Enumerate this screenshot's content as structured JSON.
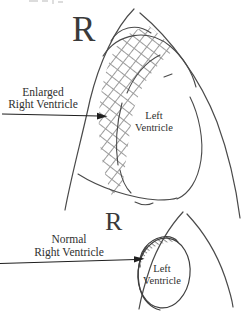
{
  "figure": {
    "background": "#ffffff",
    "line_color": "#4a4a4a",
    "hatch_color": "#9b9b9b",
    "text_color": "#2f2f2f",
    "top_panel": {
      "orientation_marker": "R",
      "pointer_label": {
        "line1": "Enlarged",
        "line2": "Right Ventricle"
      },
      "cavity_label": {
        "line1": "Left",
        "line2": "Ventricle"
      }
    },
    "bottom_panel": {
      "orientation_marker": "R",
      "pointer_label": {
        "line1": "Normal",
        "line2": "Right Ventricle"
      },
      "cavity_label": {
        "line1": "Left",
        "line2": "Ventricle"
      }
    }
  }
}
